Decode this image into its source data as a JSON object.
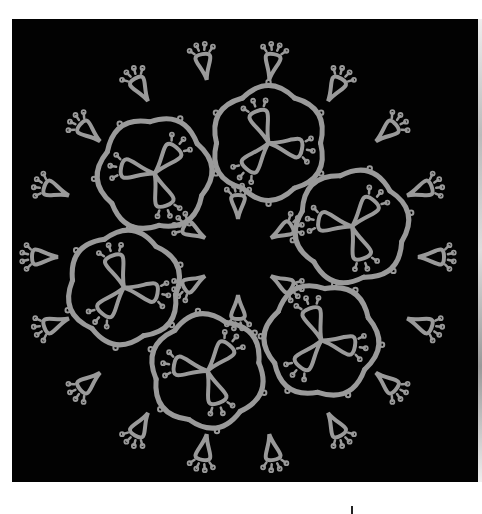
{
  "image": {
    "subject": "tatted lace doily",
    "description": "Circular tatted lace doily photographed on a black background, with six flower motifs around a central ring of small picot rings",
    "colors": {
      "background": "#020202",
      "thread": "#9a9a9a",
      "thread_highlight": "#b4b4b4",
      "page": "#ffffff"
    },
    "layout": {
      "center": [
        238,
        257
      ],
      "outer_radius": 215,
      "motif_count": 6
    }
  }
}
